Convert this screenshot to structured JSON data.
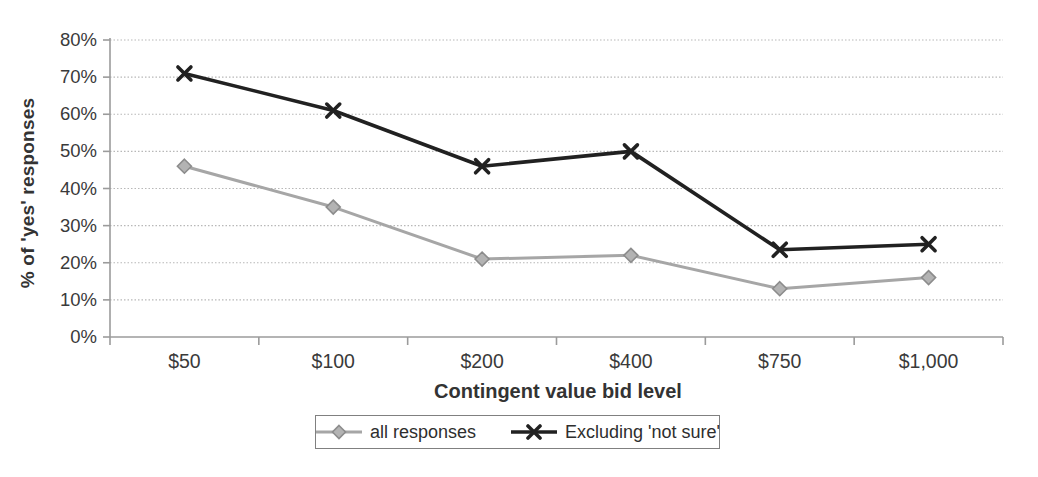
{
  "chart_data": {
    "type": "line",
    "title": "",
    "categories": [
      "$50",
      "$100",
      "$200",
      "$400",
      "$750",
      "$1,000"
    ],
    "series": [
      {
        "name": "all responses",
        "marker": "diamond",
        "color": "#a6a6a6",
        "marker_fill": "#b3b3b3",
        "marker_edge": "#8c8c8c",
        "values": [
          46,
          35,
          21,
          22,
          13,
          16
        ]
      },
      {
        "name": "Excluding 'not sure'",
        "marker": "x",
        "color": "#212121",
        "values": [
          71,
          61,
          46,
          50,
          23.5,
          25
        ]
      }
    ],
    "values_unit": "percent",
    "xlabel": "Contingent value bid level",
    "ylabel": "% of 'yes' responses",
    "ylim": [
      0,
      80
    ],
    "ytick_step": 10,
    "ytick_labels": [
      "0%",
      "10%",
      "20%",
      "30%",
      "40%",
      "50%",
      "60%",
      "70%",
      "80%"
    ],
    "grid": "horizontal",
    "legend_position": "bottom",
    "axis_color": "#9b9b9b",
    "gridline_color": "#b8b8b8",
    "tick_label_color": "#3a3a3a"
  }
}
